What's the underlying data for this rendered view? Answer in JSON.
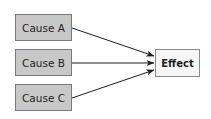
{
  "diagram": {
    "type": "cause-effect",
    "causes": [
      {
        "id": "A",
        "label": "Cause A"
      },
      {
        "id": "B",
        "label": "Cause B"
      },
      {
        "id": "C",
        "label": "Cause C"
      }
    ],
    "effect": {
      "label": "Effect"
    },
    "edges": [
      {
        "from": "Cause A",
        "to": "Effect"
      },
      {
        "from": "Cause B",
        "to": "Effect"
      },
      {
        "from": "Cause C",
        "to": "Effect"
      }
    ],
    "colors": {
      "cause_fill": "#c8c8c8",
      "cause_border": "#7a7a7a",
      "effect_fill": "#f6f6f6",
      "effect_border": "#8a8a8a",
      "arrow": "#1e1e1e"
    }
  }
}
